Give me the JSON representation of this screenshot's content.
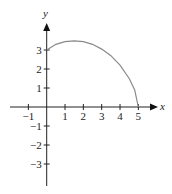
{
  "chart_data": {
    "type": "line",
    "title": "",
    "xlabel": "x",
    "ylabel": "y",
    "xlim": [
      -1.9,
      5.9
    ],
    "ylim": [
      -4.3,
      4.5
    ],
    "x_ticks": [
      -1,
      1,
      2,
      3,
      4,
      5
    ],
    "y_ticks": [
      3,
      2,
      1,
      -1,
      -2,
      -3
    ],
    "grid": false,
    "legend": null,
    "series": [
      {
        "name": "curve",
        "color": "#8a8a8a",
        "x": [
          0,
          0.5,
          1.0,
          1.5,
          2.0,
          2.5,
          3.0,
          3.5,
          4.0,
          4.5,
          4.8,
          5.0
        ],
        "y": [
          3.0,
          3.3,
          3.44,
          3.48,
          3.44,
          3.3,
          3.05,
          2.7,
          2.2,
          1.5,
          0.9,
          0.0
        ]
      }
    ]
  },
  "labels": {
    "x_axis": "x",
    "y_axis": "y",
    "x_ticks": [
      "−1",
      "1",
      "2",
      "3",
      "4",
      "5"
    ],
    "y_ticks": [
      "3",
      "2",
      "1",
      "−1",
      "−2",
      "−3"
    ]
  }
}
